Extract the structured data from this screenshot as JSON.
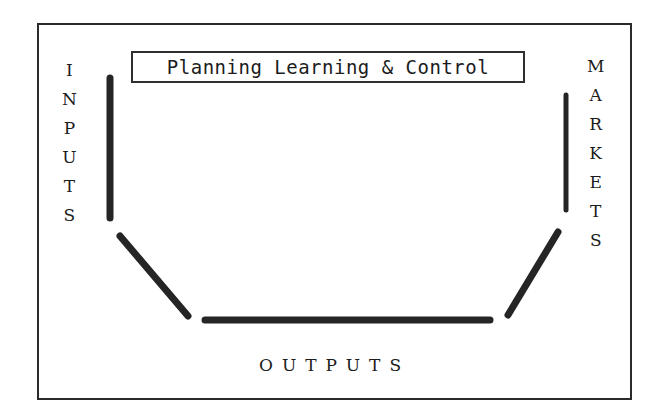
{
  "figure": {
    "title": "Planning Learning & Control",
    "background_color": "#ffffff",
    "ink_color": "#252525",
    "frame": {
      "border_color": "#2b2b2b",
      "border_width": 2
    },
    "labels": {
      "left": "INPUTS",
      "left_letters": [
        "I",
        "N",
        "P",
        "U",
        "T",
        "S"
      ],
      "right": "MARKETS",
      "right_letters": [
        "M",
        "A",
        "R",
        "K",
        "E",
        "T",
        "S"
      ],
      "bottom": "OUTPUTS"
    },
    "shape": {
      "type": "open-trapezoid-funnel",
      "segments": [
        {
          "name": "left-vertical",
          "x1": 110,
          "y1": 78,
          "x2": 110,
          "y2": 218,
          "width": 7
        },
        {
          "name": "left-diagonal",
          "x1": 120,
          "y1": 236,
          "x2": 188,
          "y2": 316,
          "width": 7
        },
        {
          "name": "bottom-horizontal",
          "x1": 205,
          "y1": 320,
          "x2": 490,
          "y2": 320,
          "width": 7
        },
        {
          "name": "right-diagonal",
          "x1": 558,
          "y1": 232,
          "x2": 508,
          "y2": 315,
          "width": 7
        },
        {
          "name": "right-vertical",
          "x1": 566,
          "y1": 95,
          "x2": 566,
          "y2": 210,
          "width": 5
        }
      ]
    }
  }
}
